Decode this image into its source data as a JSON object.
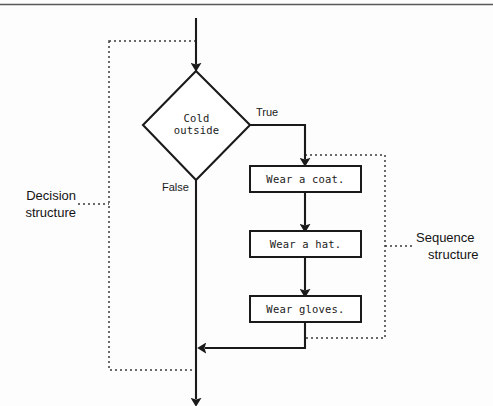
{
  "figure": {
    "kind": "flowchart",
    "title": "",
    "background_color": "#fdfdfd",
    "line_color": "#1a1a1a",
    "top_rule": true
  },
  "decision": {
    "text_line1": "Cold",
    "text_line2": "outside",
    "shape": "diamond"
  },
  "branches": {
    "true_label": "True",
    "false_label": "False"
  },
  "process_boxes": [
    {
      "label": "Wear a coat."
    },
    {
      "label": "Wear a hat."
    },
    {
      "label": "Wear gloves."
    }
  ],
  "annotations": [
    {
      "line1": "Decision",
      "line2": "structure",
      "side": "left",
      "target": "dotted-region-decision"
    },
    {
      "line1": "Sequence",
      "line2": "structure",
      "side": "right",
      "target": "dotted-region-sequence"
    }
  ],
  "dotted_regions": {
    "decision": {
      "name": "decision-structure-outline"
    },
    "sequence": {
      "name": "sequence-structure-outline"
    }
  }
}
